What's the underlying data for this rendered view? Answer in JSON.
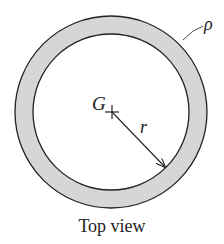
{
  "figure": {
    "caption": "Top view",
    "labels": {
      "center": "G",
      "radius": "r",
      "density": "ρ"
    },
    "colors": {
      "ring_fill": "#d6d6d6",
      "stroke": "#222222",
      "background": "#ffffff"
    },
    "geometry": {
      "center": [
        111,
        112
      ],
      "outer_radius": 96,
      "inner_radius": 78
    }
  }
}
